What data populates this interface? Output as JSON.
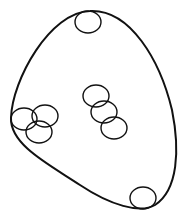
{
  "diagram": {
    "width": 187,
    "height": 219,
    "stroke_color": "#111111",
    "background": "#ffffff",
    "outer_boundary": {
      "path": "M 90 11 C 130 9, 160 60, 172 110 C 180 150, 178 190, 155 205 C 140 214, 110 205, 80 185 C 50 165, 10 145, 11 118 C 12 80, 50 12, 90 11 Z"
    },
    "circles": [
      {
        "id": "top",
        "cx": 88,
        "cy": 22,
        "rx": 13,
        "ry": 11
      },
      {
        "id": "left-a",
        "cx": 24,
        "cy": 119,
        "rx": 13,
        "ry": 11
      },
      {
        "id": "left-b",
        "cx": 45,
        "cy": 116,
        "rx": 13,
        "ry": 11
      },
      {
        "id": "left-c",
        "cx": 39,
        "cy": 132,
        "rx": 13,
        "ry": 11
      },
      {
        "id": "mid-a",
        "cx": 96,
        "cy": 96,
        "rx": 13,
        "ry": 11
      },
      {
        "id": "mid-b",
        "cx": 104,
        "cy": 112,
        "rx": 13,
        "ry": 11
      },
      {
        "id": "mid-c",
        "cx": 114,
        "cy": 128,
        "rx": 13,
        "ry": 11
      },
      {
        "id": "bottom",
        "cx": 143,
        "cy": 198,
        "rx": 13,
        "ry": 11
      }
    ]
  }
}
